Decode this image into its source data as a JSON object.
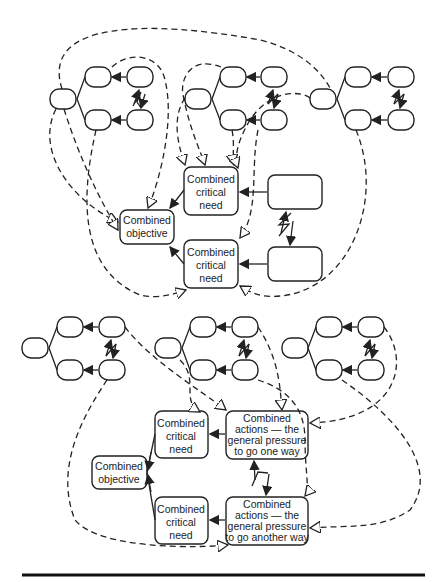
{
  "diagram": {
    "top": {
      "combined_objective": [
        "Combined",
        "objective"
      ],
      "critical_need_1": [
        "Combined",
        "critical",
        "need"
      ],
      "critical_need_2": [
        "Combined",
        "critical",
        "need"
      ]
    },
    "bottom": {
      "combined_objective": [
        "Combined",
        "objective"
      ],
      "critical_need_1": [
        "Combined",
        "critical",
        "need"
      ],
      "critical_need_2": [
        "Combined",
        "critical",
        "need"
      ],
      "actions_1": [
        "Combined",
        "actions — the",
        "general pressure",
        "to go one way"
      ],
      "actions_2": [
        "Combined",
        "actions — the",
        "general pressure",
        "to go another way"
      ]
    }
  }
}
